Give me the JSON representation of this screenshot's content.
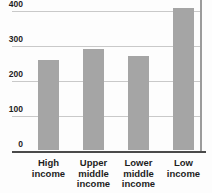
{
  "chart_data": {
    "type": "bar",
    "categories": [
      "High income",
      "Upper middle income",
      "Lower middle income",
      "Low income"
    ],
    "values": [
      260,
      290,
      270,
      410
    ],
    "title": "",
    "xlabel": "",
    "ylabel": "",
    "ylim": [
      0,
      400
    ],
    "yticks": [
      0,
      100,
      200,
      300,
      400
    ],
    "grid": true,
    "legend": "none",
    "colors": {
      "bar": "#a5a5a5",
      "gridline": "#c9c9c9",
      "axis": "#4a4a4a",
      "right_spine": "#9b9b9b",
      "text": "#1e1e1e",
      "background": "#fdfdfd"
    }
  }
}
